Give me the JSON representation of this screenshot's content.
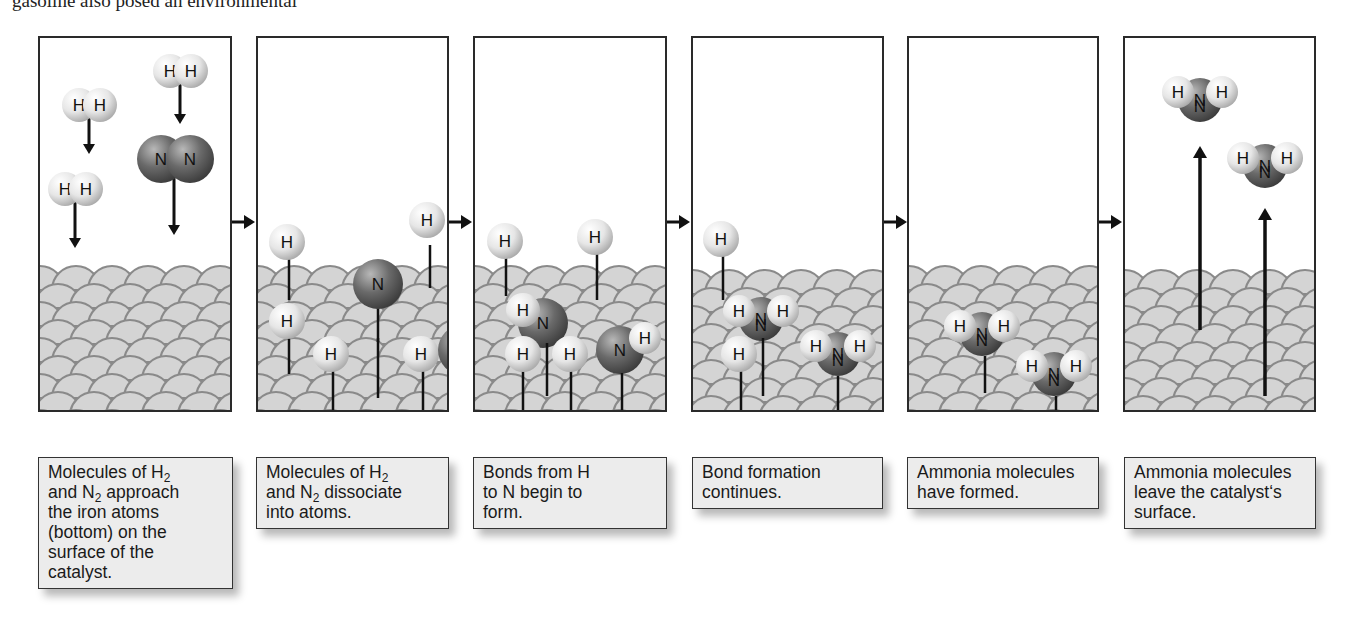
{
  "figure": {
    "title_fragment": "gasoline also posed an environmental",
    "panels": [
      {
        "id": 1,
        "caption_lines": [
          "Molecules of H|2",
          "and N|2 approach",
          "the iron atoms",
          "(bottom) on the",
          "surface of the",
          "catalyst."
        ],
        "molecules": [
          {
            "type": "H2",
            "label": "H H"
          },
          {
            "type": "H2",
            "label": "H H"
          },
          {
            "type": "H2",
            "label": "H H"
          },
          {
            "type": "N2",
            "label": "N N"
          }
        ]
      },
      {
        "id": 2,
        "caption_lines": [
          "Molecules of H|2",
          "and N|2 dissociate",
          "into atoms."
        ],
        "atoms": [
          "H",
          "H",
          "H",
          "H",
          "H",
          "H",
          "N",
          "N"
        ]
      },
      {
        "id": 3,
        "caption_lines": [
          "Bonds from H",
          "to N begin to",
          "form."
        ],
        "atoms": [
          "H",
          "H",
          "H",
          "H",
          "H",
          "N",
          "N",
          "H"
        ]
      },
      {
        "id": 4,
        "caption_lines": [
          "Bond formation",
          "continues."
        ],
        "atoms": [
          "H",
          "H",
          "N",
          "H",
          "H",
          "H",
          "N",
          "H"
        ]
      },
      {
        "id": 5,
        "caption_lines": [
          "Ammonia molecules",
          "have formed."
        ],
        "atoms": [
          "H",
          "N",
          "H",
          "H",
          "N",
          "H"
        ]
      },
      {
        "id": 6,
        "caption_lines": [
          "Ammonia molecules",
          "leave the catalyst‘s",
          "surface."
        ],
        "atoms": [
          "H",
          "N",
          "H",
          "H",
          "N",
          "H"
        ]
      }
    ],
    "atom_labels": {
      "hydrogen": "H",
      "nitrogen": "N"
    },
    "colors": {
      "panel_border": "#2a2a2a",
      "surface_fill": "#d4d4d4",
      "surface_stroke": "#8a8a8a",
      "hydrogen": "#e6e6e6",
      "nitrogen": "#6a6a6a",
      "caption_bg": "#ececec"
    }
  }
}
